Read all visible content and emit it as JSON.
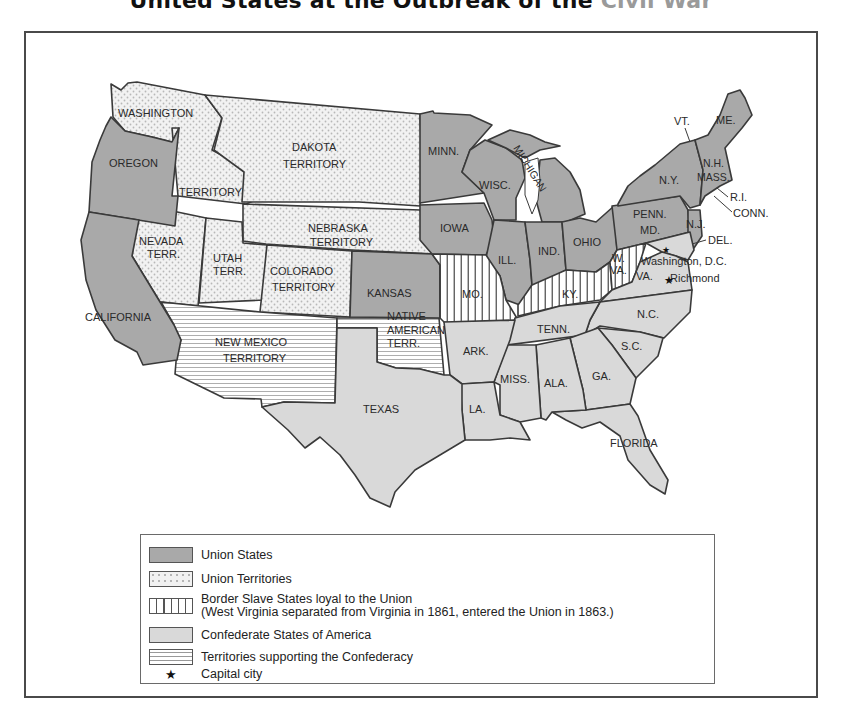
{
  "title": {
    "main": "United States at the Outbreak of the ",
    "faded": "Civil War"
  },
  "map": {
    "colors": {
      "union_states": "#a9a9a9",
      "union_territories": "#f1f1f1",
      "border_states": "#ffffff",
      "confederate_states": "#d9d9d9",
      "confederate_territories": "#ffffff",
      "outline": "#3a3a3a"
    },
    "labels": {
      "washington": "WASHINGTON",
      "washington_territory": "TERRITORY",
      "oregon": "OREGON",
      "california": "CALIFORNIA",
      "nevada_1": "NEVADA",
      "nevada_2": "TERR.",
      "utah_1": "UTAH",
      "utah_2": "TERR.",
      "dakota_1": "DAKOTA",
      "dakota_2": "TERRITORY",
      "nebraska_1": "NEBRASKA",
      "nebraska_2": "TERRITORY",
      "colorado_1": "COLORADO",
      "colorado_2": "TERRITORY",
      "kansas": "KANSAS",
      "new_mexico_1": "NEW MEXICO",
      "new_mexico_2": "TERRITORY",
      "native_1": "NATIVE",
      "native_2": "AMERICAN",
      "native_3": "TERR.",
      "texas": "TEXAS",
      "minnesota": "MINN.",
      "iowa": "IOWA",
      "missouri": "MO.",
      "arkansas": "ARK.",
      "louisiana": "LA.",
      "wisconsin": "WISC.",
      "michigan": "MICHIGAN",
      "illinois": "ILL.",
      "indiana": "IND.",
      "ohio": "OHIO",
      "kentucky": "KY.",
      "tennessee": "TENN.",
      "mississippi": "MISS.",
      "alabama": "ALA.",
      "georgia": "GA.",
      "florida": "FLORIDA",
      "south_carolina": "S.C.",
      "north_carolina": "N.C.",
      "virginia": "VA.",
      "west_virginia_1": "W.",
      "west_virginia_2": "VA.",
      "pennsylvania": "PENN.",
      "maryland": "MD.",
      "new_york": "N.Y.",
      "new_jersey": "N.J.",
      "delaware": "DEL.",
      "connecticut": "CONN.",
      "rhode_island": "R.I.",
      "massachusetts": "MASS.",
      "new_hampshire": "N.H.",
      "vermont": "VT.",
      "maine": "ME.",
      "washington_dc": "Washington, D.C.",
      "richmond": "Richmond"
    },
    "capitals": [
      {
        "name": "Washington, D.C.",
        "icon": "star-icon"
      },
      {
        "name": "Richmond",
        "icon": "star-icon"
      }
    ]
  },
  "legend": {
    "items": [
      {
        "key": "union_states",
        "label": "Union States"
      },
      {
        "key": "union_territories",
        "label": "Union Territories"
      },
      {
        "key": "border_states",
        "label": "Border Slave States loyal to the Union",
        "note": "(West Virginia separated from Virginia in 1861, entered the Union in 1863.)"
      },
      {
        "key": "confederate_states",
        "label": "Confederate States of America"
      },
      {
        "key": "confederate_territories",
        "label": "Territories supporting the Confederacy"
      },
      {
        "key": "capital_city",
        "label": "Capital city",
        "icon": "★"
      }
    ]
  }
}
